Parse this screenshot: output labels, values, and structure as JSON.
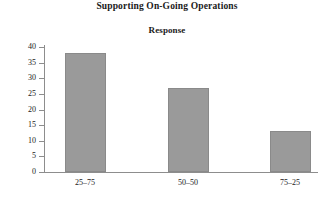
{
  "chart_data": {
    "type": "bar",
    "title": "Supporting On-Going Operations",
    "subtitle": "Response",
    "xlabel": "",
    "ylabel": "",
    "categories": [
      "25–75",
      "50–50",
      "75–25"
    ],
    "values": [
      38,
      27,
      13
    ],
    "ylim": [
      0,
      40
    ],
    "yticks": [
      0,
      5,
      10,
      15,
      20,
      25,
      30,
      35,
      40
    ],
    "ytick_labels": [
      "0",
      "5",
      "10",
      "15",
      "20",
      "25",
      "30",
      "35",
      "40"
    ],
    "grid": false,
    "legend": null,
    "bar_color": "#9a9a9a",
    "bar_edge_color": "#8a8a8a",
    "axis_color": "#8d8d8d",
    "background": "#ffffff"
  }
}
